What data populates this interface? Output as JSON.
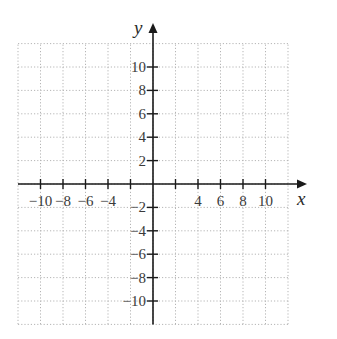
{
  "chart_data": {
    "type": "scatter",
    "title": "",
    "xlabel": "x",
    "ylabel": "y",
    "xlim": [
      -12,
      12
    ],
    "ylim": [
      -12,
      12
    ],
    "grid": true,
    "grid_style": "dotted",
    "grid_step": 2,
    "x_ticks": [
      -10,
      -8,
      -6,
      -4,
      -2,
      2,
      4,
      6,
      8,
      10
    ],
    "x_tick_labels": [
      "−10",
      "−8",
      "−6",
      "−4",
      "",
      "",
      "4",
      "6",
      "8",
      "10"
    ],
    "y_ticks": [
      10,
      8,
      6,
      4,
      2,
      -2,
      -4,
      -6,
      -8,
      -10
    ],
    "y_tick_labels": [
      "10",
      "8",
      "6",
      "4",
      "2",
      "−2",
      "−4",
      "−6",
      "−8",
      "−10"
    ],
    "series": [],
    "legend": null
  },
  "colors": {
    "axis": "#1a1a1a",
    "grid": "#b5b5b5",
    "text": "#3a3a3a"
  }
}
